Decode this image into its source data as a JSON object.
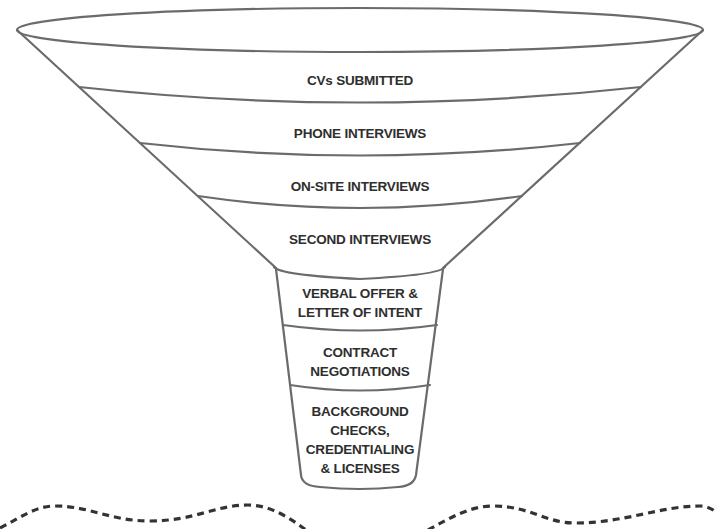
{
  "diagram": {
    "type": "funnel",
    "title": "",
    "stages": [
      {
        "id": "cvs-submitted",
        "label": "CVs SUBMITTED"
      },
      {
        "id": "phone-interviews",
        "label": "PHONE INTERVIEWS"
      },
      {
        "id": "on-site-interviews",
        "label": "ON-SITE INTERVIEWS"
      },
      {
        "id": "second-interviews",
        "label": "SECOND INTERVIEWS"
      },
      {
        "id": "verbal-offer",
        "label": "VERBAL OFFER &\nLETTER OF INTENT",
        "lines": [
          "VERBAL OFFER &",
          "LETTER OF INTENT"
        ]
      },
      {
        "id": "contract-negotiations",
        "label": "CONTRACT\nNEGOTIATIONS",
        "lines": [
          "CONTRACT",
          "NEGOTIATIONS"
        ]
      },
      {
        "id": "background-checks",
        "label": "BACKGROUND\nCHECKS,\nCREDENTIALING\n& LICENSES",
        "lines": [
          "BACKGROUND",
          "CHECKS,",
          "CREDENTIALING",
          "& LICENSES"
        ]
      }
    ],
    "colors": {
      "outline": "#6b6b6b",
      "text": "#2e2e2e",
      "dashed_line": "#333333",
      "background": "#ffffff"
    }
  }
}
